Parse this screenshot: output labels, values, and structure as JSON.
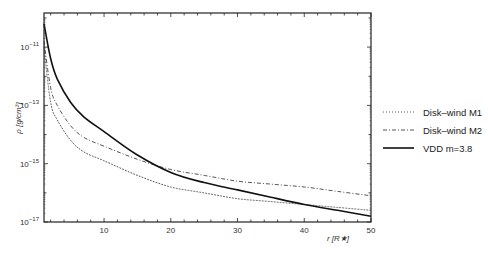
{
  "chart_data": {
    "type": "line",
    "title": "",
    "xlabel": "r [R★]",
    "ylabel": "ρ [g/cm³]",
    "xlim": [
      1,
      50
    ],
    "ylim_log10": [
      -17,
      -9.83
    ],
    "yscale": "log",
    "grid": false,
    "legend_position": "right-outside",
    "x_ticks": [
      10,
      20,
      30,
      40,
      50
    ],
    "x_tick_labels": [
      "10",
      "20",
      "30",
      "40",
      "50"
    ],
    "y_ticks_log10": [
      -11,
      -13,
      -15,
      -17
    ],
    "y_tick_labels": [
      "10⁻¹¹",
      "10⁻¹³",
      "10⁻¹⁵",
      "10⁻¹⁷"
    ],
    "x": [
      1,
      2,
      3,
      5,
      7,
      10,
      15,
      20,
      25,
      30,
      35,
      40,
      45,
      50
    ],
    "series": [
      {
        "name": "Disk–wind M1",
        "style": "dotted",
        "color": "#555555",
        "values_log10": [
          -11.0,
          -12.9,
          -13.5,
          -14.2,
          -14.6,
          -14.9,
          -15.4,
          -15.8,
          -16.0,
          -16.2,
          -16.3,
          -16.4,
          -16.5,
          -16.6
        ]
      },
      {
        "name": "Disk–wind M2",
        "style": "dash-dot",
        "color": "#555555",
        "values_log10": [
          -10.8,
          -12.4,
          -13.0,
          -13.7,
          -14.1,
          -14.4,
          -14.85,
          -15.2,
          -15.4,
          -15.6,
          -15.7,
          -15.8,
          -15.95,
          -16.1
        ]
      },
      {
        "name": "VDD m=3.8",
        "style": "solid",
        "color": "#111111",
        "values_log10": [
          -10.2,
          -11.4,
          -12.1,
          -12.9,
          -13.4,
          -13.9,
          -14.7,
          -15.3,
          -15.65,
          -15.9,
          -16.15,
          -16.4,
          -16.6,
          -16.8
        ]
      }
    ]
  },
  "axes": {
    "xlabel_main": "r",
    "xlabel_unit": "[R★]",
    "ylabel_text": "ρ [g/cm³]"
  },
  "legend": {
    "items": [
      {
        "label": "Disk–wind M1"
      },
      {
        "label": "Disk–wind M2"
      },
      {
        "label": "VDD m=3.8"
      }
    ]
  }
}
